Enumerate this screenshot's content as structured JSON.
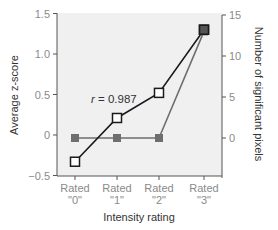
{
  "chart_data": {
    "type": "line",
    "title": "",
    "xlabel": "Intensity rating",
    "ylabel": "Average z-score",
    "y2label": "Number of significant pixels",
    "categories": [
      "Rated \"0\"",
      "Rated \"1\"",
      "Rated \"2\"",
      "Rated \"3\""
    ],
    "category_lines": [
      [
        "Rated",
        "\"0\""
      ],
      [
        "Rated",
        "\"1\""
      ],
      [
        "Rated",
        "\"2\""
      ],
      [
        "Rated",
        "\"3\""
      ]
    ],
    "series": [
      {
        "name": "Average z-score",
        "axis": "left",
        "marker": "open-square",
        "color": "#1a1a1a",
        "values": [
          -0.33,
          0.21,
          0.52,
          1.3
        ]
      },
      {
        "name": "Number of significant pixels",
        "axis": "right",
        "marker": "filled-square",
        "color": "#6e6e6e",
        "values": [
          0,
          0,
          0,
          13
        ]
      }
    ],
    "ylim": [
      -0.5,
      1.5
    ],
    "yticks": [
      -0.5,
      0,
      0.5,
      1.0,
      1.5
    ],
    "ytick_labels": [
      "−0.5",
      "0",
      "0.5",
      "1.0",
      "1.5"
    ],
    "y2lim": [
      -4.2,
      15
    ],
    "y2ticks": [
      0,
      5,
      10,
      15
    ],
    "y2tick_labels": [
      "0",
      "5",
      "10",
      "15"
    ],
    "annotations": [
      {
        "text_italic": "r",
        "text": " = 0.987",
        "x_category": 1,
        "y": 0.5
      }
    ],
    "grid": false,
    "legend": "none",
    "plot_background": "#f0f0f0"
  }
}
